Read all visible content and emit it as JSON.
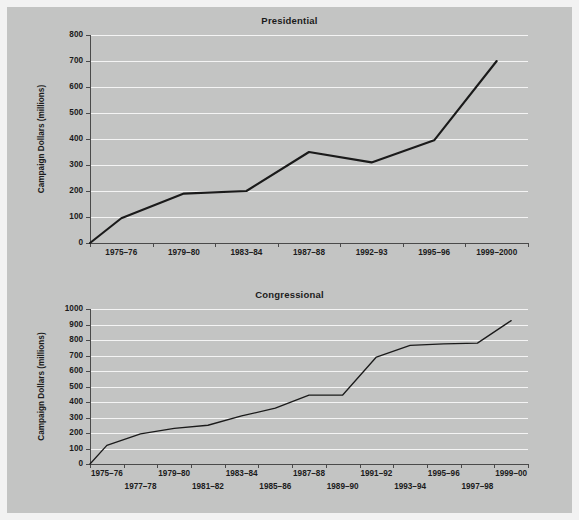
{
  "figure": {
    "background_color": "#c3c4c3",
    "page_background_color": "#f2f2f2",
    "gridline_color": "#f4f4f4",
    "axis_color": "#4a4a4a",
    "line_color": "#1a1a1a"
  },
  "chart_data": [
    {
      "type": "line",
      "title": "Presidential",
      "xlabel": "",
      "ylabel": "Campaign Dollars (millions)",
      "ylim": [
        0,
        800
      ],
      "ytick_step": 100,
      "yticks": [
        0,
        100,
        200,
        300,
        400,
        500,
        600,
        700,
        800
      ],
      "ytick_labels": [
        "0",
        "100",
        "200",
        "300",
        "400",
        "500",
        "600",
        "700",
        "800"
      ],
      "categories": [
        "1975–76",
        "1979–80",
        "1983–84",
        "1987–88",
        "1992–93",
        "1995–96",
        "1999–2000"
      ],
      "values": [
        95,
        190,
        200,
        350,
        310,
        395,
        700
      ],
      "origin_value": 0,
      "grid": true,
      "legend": "none"
    },
    {
      "type": "line",
      "title": "Congressional",
      "xlabel": "",
      "ylabel": "Campaign Dollars (millions)",
      "ylim": [
        0,
        1000
      ],
      "ytick_step": 100,
      "yticks": [
        0,
        100,
        200,
        300,
        400,
        500,
        600,
        700,
        800,
        900,
        1000
      ],
      "ytick_labels": [
        "0",
        "100",
        "200",
        "300",
        "400",
        "500",
        "600",
        "700",
        "800",
        "900",
        "1000"
      ],
      "categories": [
        "1975–76",
        "1977–78",
        "1979–80",
        "1981–82",
        "1983–84",
        "1985–86",
        "1987–88",
        "1989–90",
        "1991–92",
        "1993–94",
        "1995–96",
        "1997–98",
        "1999–00"
      ],
      "values": [
        120,
        195,
        230,
        250,
        310,
        360,
        445,
        445,
        690,
        765,
        775,
        780,
        925
      ],
      "origin_value": 0,
      "grid": true,
      "legend": "none"
    }
  ]
}
